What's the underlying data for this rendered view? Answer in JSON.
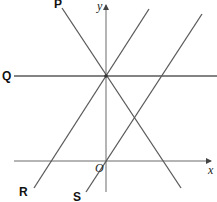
{
  "diagram": {
    "type": "coordinate-lines",
    "axes": {
      "x_label": "x",
      "y_label": "y",
      "origin_label": "O"
    },
    "lines": [
      {
        "id": "P",
        "label": "P",
        "description": "line with negative gradient through point on y-axis"
      },
      {
        "id": "Q",
        "label": "Q",
        "description": "horizontal line through point on y-axis"
      },
      {
        "id": "R",
        "label": "R",
        "description": "line with positive gradient through same point on y-axis"
      },
      {
        "id": "S",
        "label": "S",
        "description": "line with positive gradient through origin, parallel to R"
      }
    ],
    "intersection_point": "common point of P, Q, R on positive y-axis",
    "colors": {
      "lines": "#5a5a5a",
      "labels": "#111111",
      "background": "#ffffff"
    }
  }
}
